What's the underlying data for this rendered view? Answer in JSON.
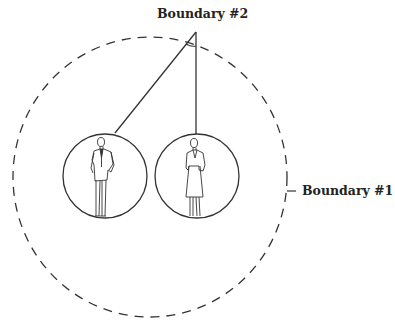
{
  "diagram": {
    "labels": {
      "boundary_2": "Boundary #2",
      "boundary_1": "Boundary #1"
    },
    "elements": {
      "outer_boundary": {
        "cx": 150,
        "cy": 177,
        "rx": 137,
        "ry": 140,
        "style": "dashed"
      },
      "person_circles": [
        {
          "name": "man",
          "cx": 105,
          "cy": 176,
          "r": 42
        },
        {
          "name": "woman",
          "cx": 197,
          "cy": 176,
          "r": 42
        }
      ],
      "apex": {
        "x": 196,
        "y": 32
      }
    },
    "colors": {
      "stroke": "#333333",
      "background": "#ffffff"
    }
  }
}
